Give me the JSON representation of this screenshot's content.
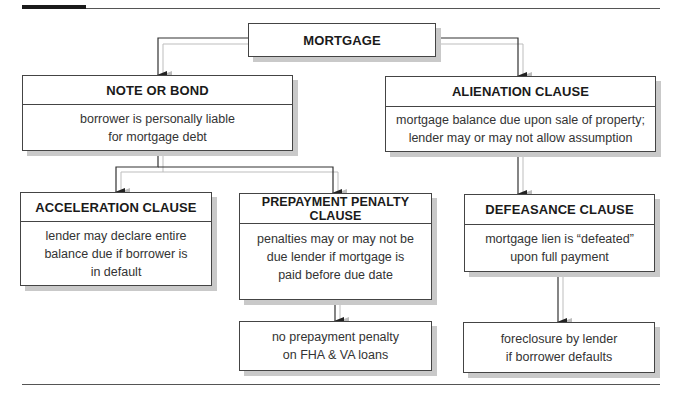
{
  "diagram": {
    "root": {
      "title": "MORTGAGE"
    },
    "note_or_bond": {
      "title": "NOTE OR BOND",
      "body": "borrower is personally liable for mortgage debt",
      "lines": [
        "borrower is personally liable",
        "for mortgage debt"
      ]
    },
    "alienation_clause": {
      "title": "ALIENATION CLAUSE",
      "body": "mortgage balance due upon sale of property; lender may or may not allow assumption",
      "lines": [
        "mortgage balance due upon sale of property;",
        "lender may or may not allow assumption"
      ]
    },
    "acceleration_clause": {
      "title": "ACCELERATION CLAUSE",
      "body": "lender may declare entire balance due if borrower is in default",
      "lines": [
        "lender may declare entire",
        "balance due if borrower is",
        "in default"
      ]
    },
    "prepayment_penalty_clause": {
      "title": "PREPAYMENT PENALTY CLAUSE",
      "body": "penalties may or may not be due lender if mortgage is paid before due date",
      "lines": [
        "penalties may or may not be",
        "due lender if mortgage is",
        "paid before due date"
      ]
    },
    "defeasance_clause": {
      "title": "DEFEASANCE CLAUSE",
      "body": "mortgage lien is “defeated” upon full payment",
      "lines": [
        "mortgage lien is “defeated”",
        "upon full payment"
      ]
    },
    "no_prepayment_penalty": {
      "body": "no prepayment penalty on FHA & VA loans",
      "lines": [
        "no prepayment penalty",
        "on FHA & VA loans"
      ]
    },
    "foreclosure": {
      "body": "foreclosure by lender if borrower defaults",
      "lines": [
        "foreclosure by lender",
        "if borrower defaults"
      ]
    },
    "edges": [
      {
        "from": "MORTGAGE",
        "to": "NOTE OR BOND"
      },
      {
        "from": "MORTGAGE",
        "to": "ALIENATION CLAUSE"
      },
      {
        "from": "NOTE OR BOND",
        "to": "ACCELERATION CLAUSE"
      },
      {
        "from": "NOTE OR BOND",
        "to": "PREPAYMENT PENALTY CLAUSE"
      },
      {
        "from": "PREPAYMENT PENALTY CLAUSE",
        "to": "no prepayment penalty on FHA & VA loans"
      },
      {
        "from": "ALIENATION CLAUSE",
        "to": "DEFEASANCE CLAUSE"
      },
      {
        "from": "DEFEASANCE CLAUSE",
        "to": "foreclosure by lender if borrower defaults"
      }
    ]
  },
  "colors": {
    "line": "#333333",
    "shadow": "#c9c9c9",
    "connector_shadow": "#bdbdbd",
    "text": "#222222"
  }
}
